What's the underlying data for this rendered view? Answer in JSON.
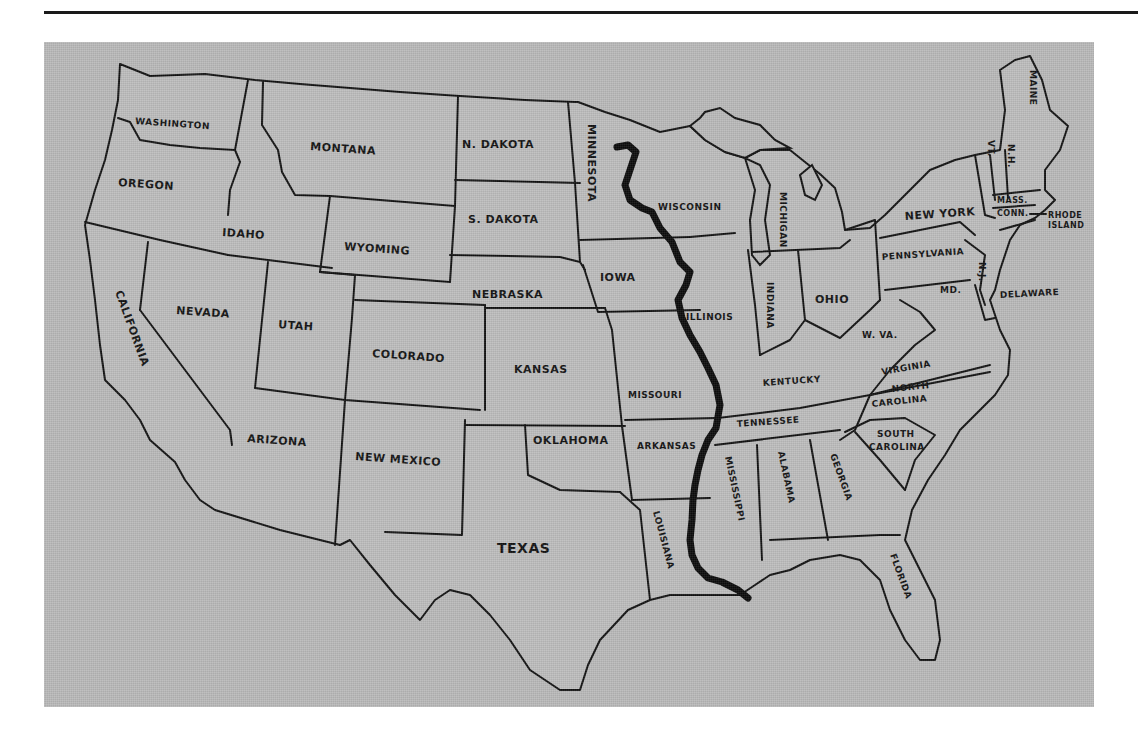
{
  "map": {
    "title": "",
    "feature": "Mississippi River",
    "colors": {
      "land": "#bdbdbd",
      "background_panel": "#b9b9b9",
      "outline": "#111111",
      "river": "#0a0a0a",
      "page": "#ffffff"
    },
    "states": [
      {
        "id": "washington",
        "label": "WASHINGTON"
      },
      {
        "id": "oregon",
        "label": "OREGON"
      },
      {
        "id": "california",
        "label": "CALIFORNIA"
      },
      {
        "id": "nevada",
        "label": "NEVADA"
      },
      {
        "id": "idaho",
        "label": "IDAHO"
      },
      {
        "id": "montana",
        "label": "MONTANA"
      },
      {
        "id": "wyoming",
        "label": "WYOMING"
      },
      {
        "id": "utah",
        "label": "UTAH"
      },
      {
        "id": "arizona",
        "label": "ARIZONA"
      },
      {
        "id": "colorado",
        "label": "COLORADO"
      },
      {
        "id": "new_mexico",
        "label": "NEW MEXICO"
      },
      {
        "id": "north_dakota",
        "label": "N. DAKOTA"
      },
      {
        "id": "south_dakota",
        "label": "S. DAKOTA"
      },
      {
        "id": "nebraska",
        "label": "NEBRASKA"
      },
      {
        "id": "kansas",
        "label": "KANSAS"
      },
      {
        "id": "oklahoma",
        "label": "OKLAHOMA"
      },
      {
        "id": "texas",
        "label": "TEXAS"
      },
      {
        "id": "minnesota",
        "label": "MINNESOTA"
      },
      {
        "id": "iowa",
        "label": "IOWA"
      },
      {
        "id": "missouri",
        "label": "MISSOURI"
      },
      {
        "id": "arkansas",
        "label": "ARKANSAS"
      },
      {
        "id": "louisiana",
        "label": "LOUISIANA"
      },
      {
        "id": "wisconsin",
        "label": "WISCONSIN"
      },
      {
        "id": "illinois",
        "label": "ILLINOIS"
      },
      {
        "id": "michigan",
        "label": "MICHIGAN"
      },
      {
        "id": "indiana",
        "label": "INDIANA"
      },
      {
        "id": "ohio",
        "label": "OHIO"
      },
      {
        "id": "kentucky",
        "label": "KENTUCKY"
      },
      {
        "id": "tennessee",
        "label": "TENNESSEE"
      },
      {
        "id": "mississippi",
        "label": "MISSISSIPPI"
      },
      {
        "id": "alabama",
        "label": "ALABAMA"
      },
      {
        "id": "georgia",
        "label": "GEORGIA"
      },
      {
        "id": "florida",
        "label": "FLORIDA"
      },
      {
        "id": "south_carolina",
        "label_line1": "SOUTH",
        "label_line2": "CAROLINA"
      },
      {
        "id": "north_carolina",
        "label_line1": "NORTH",
        "label_line2": "CAROLINA"
      },
      {
        "id": "virginia",
        "label": "VIRGINIA"
      },
      {
        "id": "west_virginia",
        "label": "W. VA."
      },
      {
        "id": "pennsylvania",
        "label": "PENNSYLVANIA"
      },
      {
        "id": "new_york",
        "label": "NEW YORK"
      },
      {
        "id": "maryland",
        "label": "MD."
      },
      {
        "id": "delaware",
        "label": "DELAWARE"
      },
      {
        "id": "new_jersey",
        "label": "N.J."
      },
      {
        "id": "vermont",
        "label": "VT."
      },
      {
        "id": "new_hampshire",
        "label": "N.H."
      },
      {
        "id": "maine",
        "label": "MAINE"
      },
      {
        "id": "massachusetts",
        "label": "MASS."
      },
      {
        "id": "connecticut",
        "label": "CONN."
      },
      {
        "id": "rhode_island",
        "label_line1": "RHODE",
        "label_line2": "ISLAND"
      }
    ]
  }
}
